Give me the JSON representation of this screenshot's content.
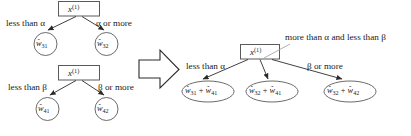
{
  "figure": {
    "type": "decision-tree-merge-diagram",
    "background_color": "#ffffff",
    "stroke_color": "#2b2b2b",
    "text_color": "#1a1a1a"
  },
  "left_tree_top": {
    "root_label": "x",
    "root_superscript": "(1)",
    "edge_labels": {
      "left": "less than α",
      "right": "α or more"
    },
    "leaves": [
      {
        "symbol": "w",
        "hat": "̂",
        "subscript": "31"
      },
      {
        "symbol": "w",
        "hat": "̂",
        "subscript": "32"
      }
    ]
  },
  "left_tree_bottom": {
    "root_label": "x",
    "root_superscript": "(1)",
    "edge_labels": {
      "left": "less than β",
      "right": "β or more"
    },
    "leaves": [
      {
        "symbol": "w",
        "hat": "̂",
        "subscript": "41"
      },
      {
        "symbol": "w",
        "hat": "̂",
        "subscript": "42"
      }
    ]
  },
  "merge_arrow": {
    "name": "block-arrow-right",
    "direction": "right"
  },
  "right_tree": {
    "root_label": "x",
    "root_superscript": "(1)",
    "edge_labels": {
      "left": "less than α",
      "middle": "more than α and less than β",
      "right": "β or more"
    },
    "leaves": [
      {
        "terms": [
          {
            "symbol": "w",
            "subscript": "31"
          },
          {
            "symbol": "w",
            "subscript": "41"
          }
        ],
        "operator": "+"
      },
      {
        "terms": [
          {
            "symbol": "w",
            "subscript": "32"
          },
          {
            "symbol": "w",
            "subscript": "41"
          }
        ],
        "operator": "+"
      },
      {
        "terms": [
          {
            "symbol": "w",
            "subscript": "32"
          },
          {
            "symbol": "w",
            "subscript": "42"
          }
        ],
        "operator": "+"
      }
    ]
  }
}
